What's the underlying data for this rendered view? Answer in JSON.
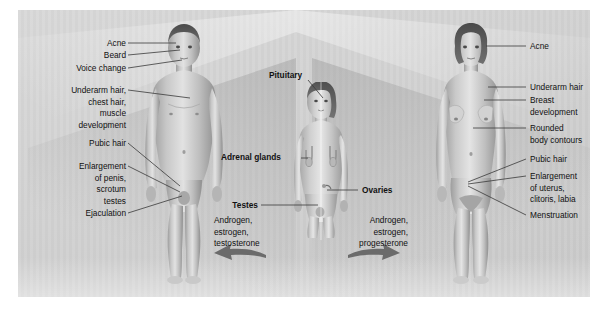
{
  "diagram": {
    "panel_bg": "#d2d2d2",
    "line_color": "#3a3a3a",
    "text_color": "#111111"
  },
  "male_labels": [
    {
      "id": "acne",
      "text": "Acne"
    },
    {
      "id": "beard",
      "text": "Beard"
    },
    {
      "id": "voice",
      "text": "Voice change"
    },
    {
      "id": "underarm",
      "text": "Underarm hair,\nchest hair,\nmuscle\ndevelopment"
    },
    {
      "id": "pubic",
      "text": "Pubic hair"
    },
    {
      "id": "enlargement",
      "text": "Enlargement\nof penis,\nscrotum\ntestes"
    },
    {
      "id": "ejaculation",
      "text": "Ejaculation"
    }
  ],
  "female_labels": [
    {
      "id": "acne",
      "text": "Acne"
    },
    {
      "id": "underarm",
      "text": "Underarm hair"
    },
    {
      "id": "breast",
      "text": "Breast\ndevelopment"
    },
    {
      "id": "rounded",
      "text": "Rounded\nbody contours"
    },
    {
      "id": "pubic",
      "text": "Pubic hair"
    },
    {
      "id": "enlargement",
      "text": "Enlargement\nof uterus,\nclitoris, labia"
    },
    {
      "id": "menstruation",
      "text": "Menstruation"
    }
  ],
  "center_labels": [
    {
      "id": "pituitary",
      "text": "Pituitary"
    },
    {
      "id": "adrenal",
      "text": "Adrenal glands"
    },
    {
      "id": "ovaries",
      "text": "Ovaries"
    },
    {
      "id": "testes",
      "text": "Testes"
    }
  ],
  "hormones": {
    "male": {
      "text": "Androgen,\nestrogen,\ntestosterone",
      "arrow": "left"
    },
    "female": {
      "text": "Androgen,\nestrogen,\nprogesterone",
      "arrow": "right"
    }
  }
}
